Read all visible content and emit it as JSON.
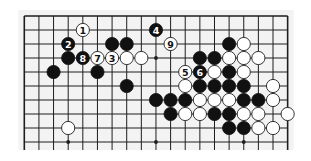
{
  "diagram": {
    "type": "go-board-fragment",
    "background": "#f3f3f3",
    "line_color": "#1e1e1e",
    "columns": 19,
    "visible_rows": 10,
    "edges": {
      "top": true,
      "left": true,
      "right": true,
      "bottom": false
    },
    "geometry": {
      "x0": 24.3,
      "y0": 16,
      "dx": 14.63,
      "dy": 14,
      "stone_radius": 6.6
    },
    "star_points": [
      {
        "col": 3,
        "row": 3
      },
      {
        "col": 9,
        "row": 3
      },
      {
        "col": 15,
        "row": 3
      },
      {
        "col": 3,
        "row": 9
      },
      {
        "col": 9,
        "row": 9
      },
      {
        "col": 15,
        "row": 9
      }
    ],
    "stones": [
      {
        "col": 4,
        "row": 1,
        "color": "white",
        "label": "1"
      },
      {
        "col": 9,
        "row": 1,
        "color": "black",
        "label": "4"
      },
      {
        "col": 3,
        "row": 2,
        "color": "black",
        "label": "2"
      },
      {
        "col": 6,
        "row": 2,
        "color": "black",
        "label": ""
      },
      {
        "col": 7,
        "row": 2,
        "color": "black",
        "label": ""
      },
      {
        "col": 10,
        "row": 2,
        "color": "white",
        "label": "9"
      },
      {
        "col": 14,
        "row": 2,
        "color": "black",
        "label": ""
      },
      {
        "col": 15,
        "row": 2,
        "color": "white",
        "label": ""
      },
      {
        "col": 3,
        "row": 3,
        "color": "black",
        "label": ""
      },
      {
        "col": 4,
        "row": 3,
        "color": "black",
        "label": "8"
      },
      {
        "col": 5,
        "row": 3,
        "color": "white",
        "label": "7"
      },
      {
        "col": 6,
        "row": 3,
        "color": "white",
        "label": "3"
      },
      {
        "col": 7,
        "row": 3,
        "color": "white",
        "label": ""
      },
      {
        "col": 8,
        "row": 3,
        "color": "white",
        "label": ""
      },
      {
        "col": 12,
        "row": 3,
        "color": "black",
        "label": ""
      },
      {
        "col": 13,
        "row": 3,
        "color": "black",
        "label": ""
      },
      {
        "col": 14,
        "row": 3,
        "color": "white",
        "label": ""
      },
      {
        "col": 15,
        "row": 3,
        "color": "white",
        "label": ""
      },
      {
        "col": 16,
        "row": 3,
        "color": "white",
        "label": ""
      },
      {
        "col": 2,
        "row": 4,
        "color": "black",
        "label": ""
      },
      {
        "col": 5,
        "row": 4,
        "color": "black",
        "label": ""
      },
      {
        "col": 11,
        "row": 4,
        "color": "white",
        "label": "5"
      },
      {
        "col": 12,
        "row": 4,
        "color": "black",
        "label": "6"
      },
      {
        "col": 13,
        "row": 4,
        "color": "white",
        "label": ""
      },
      {
        "col": 14,
        "row": 4,
        "color": "black",
        "label": ""
      },
      {
        "col": 15,
        "row": 4,
        "color": "white",
        "label": ""
      },
      {
        "col": 7,
        "row": 5,
        "color": "black",
        "label": ""
      },
      {
        "col": 11,
        "row": 5,
        "color": "white",
        "label": ""
      },
      {
        "col": 12,
        "row": 5,
        "color": "black",
        "label": ""
      },
      {
        "col": 13,
        "row": 5,
        "color": "black",
        "label": ""
      },
      {
        "col": 14,
        "row": 5,
        "color": "black",
        "label": ""
      },
      {
        "col": 15,
        "row": 5,
        "color": "black",
        "label": ""
      },
      {
        "col": 17,
        "row": 5,
        "color": "white",
        "label": ""
      },
      {
        "col": 9,
        "row": 6,
        "color": "black",
        "label": ""
      },
      {
        "col": 10,
        "row": 6,
        "color": "black",
        "label": ""
      },
      {
        "col": 11,
        "row": 6,
        "color": "black",
        "label": ""
      },
      {
        "col": 12,
        "row": 6,
        "color": "white",
        "label": ""
      },
      {
        "col": 13,
        "row": 6,
        "color": "white",
        "label": ""
      },
      {
        "col": 14,
        "row": 6,
        "color": "white",
        "label": ""
      },
      {
        "col": 15,
        "row": 6,
        "color": "black",
        "label": ""
      },
      {
        "col": 16,
        "row": 6,
        "color": "black",
        "label": ""
      },
      {
        "col": 17,
        "row": 6,
        "color": "white",
        "label": ""
      },
      {
        "col": 10,
        "row": 7,
        "color": "black",
        "label": ""
      },
      {
        "col": 11,
        "row": 7,
        "color": "white",
        "label": ""
      },
      {
        "col": 12,
        "row": 7,
        "color": "white",
        "label": ""
      },
      {
        "col": 13,
        "row": 7,
        "color": "black",
        "label": ""
      },
      {
        "col": 14,
        "row": 7,
        "color": "black",
        "label": ""
      },
      {
        "col": 15,
        "row": 7,
        "color": "white",
        "label": ""
      },
      {
        "col": 16,
        "row": 7,
        "color": "white",
        "label": ""
      },
      {
        "col": 18,
        "row": 7,
        "color": "white",
        "label": ""
      },
      {
        "col": 3,
        "row": 8,
        "color": "white",
        "label": ""
      },
      {
        "col": 14,
        "row": 8,
        "color": "black",
        "label": ""
      },
      {
        "col": 15,
        "row": 8,
        "color": "black",
        "label": ""
      },
      {
        "col": 16,
        "row": 8,
        "color": "white",
        "label": ""
      },
      {
        "col": 17,
        "row": 8,
        "color": "white",
        "label": ""
      }
    ]
  }
}
